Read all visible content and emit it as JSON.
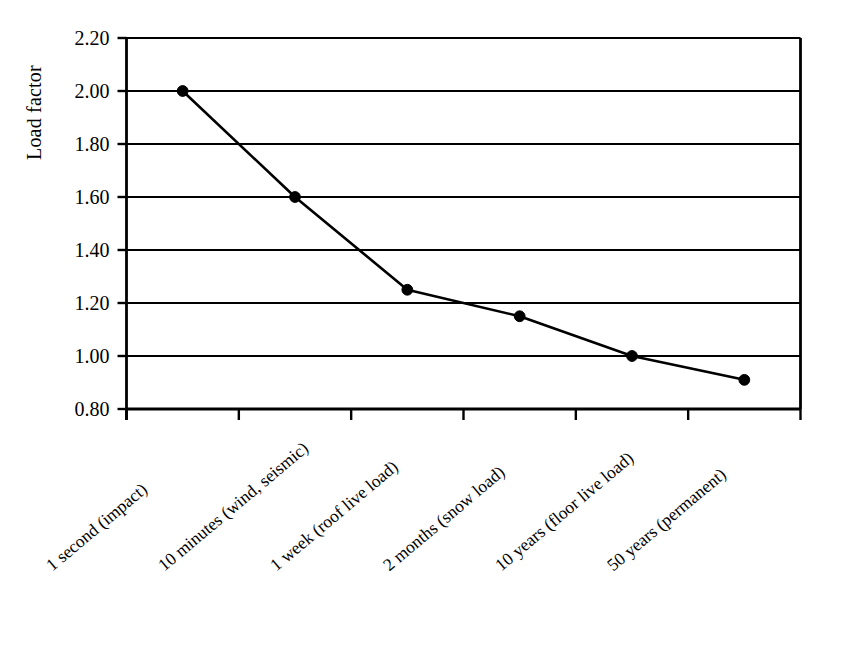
{
  "chart_data": {
    "type": "line",
    "title": "",
    "xlabel": "",
    "ylabel": "Load factor",
    "ylim": [
      0.8,
      2.2
    ],
    "ytick_step": 0.2,
    "grid": "horizontal",
    "legend": "none",
    "categories": [
      "1 second (impact)",
      "10 minutes (wind, seismic)",
      "1 week (roof live load)",
      "2 months (snow load)",
      "10 years (floor live load)",
      "50 years (permanent)"
    ],
    "values": [
      2.0,
      1.6,
      1.25,
      1.15,
      1.0,
      0.91
    ],
    "ytick_labels": [
      "2.20",
      "2.00",
      "1.80",
      "1.60",
      "1.40",
      "1.20",
      "1.00",
      "0.80"
    ],
    "ytick_values": [
      2.2,
      2.0,
      1.8,
      1.6,
      1.4,
      1.2,
      1.0,
      0.8
    ],
    "series": [
      {
        "name": "Load factor",
        "values": [
          2.0,
          1.6,
          1.25,
          1.15,
          1.0,
          0.91
        ],
        "line_color": "#000000",
        "marker": "filled-circle",
        "marker_color": "#000000"
      }
    ],
    "colors": {
      "line": "#000000",
      "marker": "#000000",
      "grid": "#000000",
      "axis": "#000000",
      "background": "#ffffff",
      "text": "#000000"
    }
  }
}
